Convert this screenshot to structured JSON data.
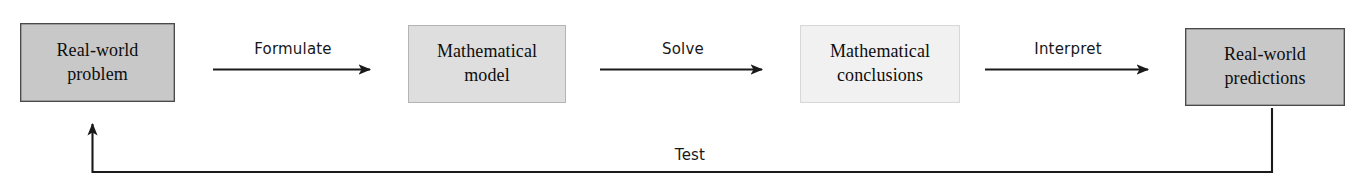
{
  "diagram": {
    "canvas": {
      "width": 1369,
      "height": 191,
      "background": "#ffffff"
    },
    "nodes": [
      {
        "id": "real-world-problem",
        "line1": "Real-world",
        "line2": "problem",
        "fill": "#c8c8c8",
        "border": "#4a4a4a",
        "x": 20,
        "y": 23,
        "w": 155,
        "h": 79
      },
      {
        "id": "mathematical-model",
        "line1": "Mathematical",
        "line2": "model",
        "fill": "#dedede",
        "border": "#b4b4b4",
        "x": 408,
        "y": 25,
        "w": 158,
        "h": 78
      },
      {
        "id": "mathematical-conclusions",
        "line1": "Mathematical",
        "line2": "conclusions",
        "fill": "#f1f1f1",
        "border": "#d8d8d8",
        "x": 800,
        "y": 25,
        "w": 160,
        "h": 78
      },
      {
        "id": "real-world-predictions",
        "line1": "Real-world",
        "line2": "predictions",
        "fill": "#c8c8c8",
        "border": "#4a4a4a",
        "x": 1185,
        "y": 28,
        "w": 160,
        "h": 78
      }
    ],
    "edges": [
      {
        "id": "formulate",
        "label": "Formulate",
        "from": "real-world-problem",
        "to": "mathematical-model",
        "label_x": 293,
        "label_y": 40
      },
      {
        "id": "solve",
        "label": "Solve",
        "from": "mathematical-model",
        "to": "mathematical-conclusions",
        "label_x": 683,
        "label_y": 40
      },
      {
        "id": "interpret",
        "label": "Interpret",
        "from": "mathematical-conclusions",
        "to": "real-world-predictions",
        "label_x": 1068,
        "label_y": 40
      },
      {
        "id": "test",
        "label": "Test",
        "from": "real-world-predictions",
        "to": "real-world-problem",
        "label_x": 690,
        "label_y": 146
      }
    ],
    "stroke_color": "#1a1a1a"
  }
}
